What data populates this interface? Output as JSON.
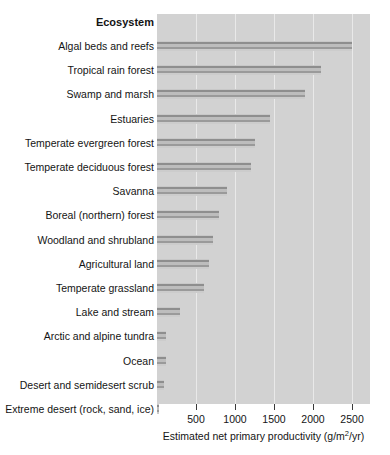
{
  "chart_data": {
    "type": "bar",
    "orientation": "horizontal",
    "title": "",
    "category_header": "Ecosystem",
    "xlabel_prefix": "Estimated net primary productivity (g/m",
    "xlabel_sup": "2",
    "xlabel_suffix": "/yr)",
    "xlabel": "Estimated net primary productivity (g/m2/yr)",
    "ylabel": "Ecosystem",
    "xlim": [
      0,
      2730
    ],
    "xticks": [
      500,
      1000,
      1500,
      2000,
      2500
    ],
    "xtick_labels": [
      "500",
      "1000",
      "1500",
      "2000",
      "2500"
    ],
    "grid": "vertical-only",
    "legend": "none",
    "plot_background": "#d2d2d2",
    "bar_color": "#9a9a9a",
    "categories": [
      "Algal beds and reefs",
      "Tropical rain forest",
      "Swamp and marsh",
      "Estuaries",
      "Temperate evergreen forest",
      "Temperate deciduous forest",
      "Savanna",
      "Boreal (northern) forest",
      "Woodland and shrubland",
      "Agricultural land",
      "Temperate grassland",
      "Lake and stream",
      "Arctic and alpine tundra",
      "Ocean",
      "Desert and semidesert scrub",
      "Extreme desert (rock, sand, ice)"
    ],
    "values": [
      2500,
      2100,
      1900,
      1450,
      1250,
      1200,
      900,
      800,
      720,
      670,
      600,
      300,
      120,
      110,
      95,
      10
    ]
  }
}
